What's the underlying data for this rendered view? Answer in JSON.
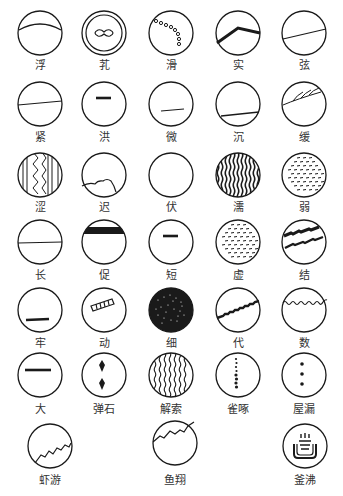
{
  "title": "",
  "pulses": [
    {
      "id": "fu",
      "label": "浮",
      "cx": 40,
      "cy": 33,
      "ly": 66,
      "shape": "arc-top"
    },
    {
      "id": "kou",
      "label": "芤",
      "cx": 104,
      "cy": 33,
      "ly": 66,
      "shape": "double-ring"
    },
    {
      "id": "hua",
      "label": "滑",
      "cx": 171,
      "cy": 33,
      "ly": 66,
      "shape": "beads"
    },
    {
      "id": "shi",
      "label": "实",
      "cx": 238,
      "cy": 33,
      "ly": 66,
      "shape": "bent-thick"
    },
    {
      "id": "xian",
      "label": "弦",
      "cx": 304,
      "cy": 33,
      "ly": 66,
      "shape": "diagonal-line"
    },
    {
      "id": "jin",
      "label": "紧",
      "cx": 40,
      "cy": 104,
      "ly": 138,
      "shape": "upper-line"
    },
    {
      "id": "hong",
      "label": "洪",
      "cx": 104,
      "cy": 104,
      "ly": 138,
      "shape": "short-top-thick"
    },
    {
      "id": "wei",
      "label": "微",
      "cx": 171,
      "cy": 104,
      "ly": 138,
      "shape": "low-thin-line"
    },
    {
      "id": "chen",
      "label": "沉",
      "cx": 238,
      "cy": 104,
      "ly": 138,
      "shape": "low-line"
    },
    {
      "id": "huan",
      "label": "缓",
      "cx": 304,
      "cy": 104,
      "ly": 138,
      "shape": "feather"
    },
    {
      "id": "se",
      "label": "涩",
      "cx": 40,
      "cy": 175,
      "ly": 208,
      "shape": "zigzag-stripes"
    },
    {
      "id": "chi",
      "label": "迟",
      "cx": 104,
      "cy": 175,
      "ly": 208,
      "shape": "low-waves"
    },
    {
      "id": "fu2",
      "label": "伏",
      "cx": 171,
      "cy": 175,
      "ly": 208,
      "shape": "empty"
    },
    {
      "id": "ru",
      "label": "濡",
      "cx": 238,
      "cy": 175,
      "ly": 208,
      "shape": "dense-stripes"
    },
    {
      "id": "ruo",
      "label": "弱",
      "cx": 304,
      "cy": 175,
      "ly": 208,
      "shape": "dashes"
    },
    {
      "id": "chang",
      "label": "长",
      "cx": 40,
      "cy": 242,
      "ly": 276,
      "shape": "mid-line"
    },
    {
      "id": "cu",
      "label": "促",
      "cx": 104,
      "cy": 242,
      "ly": 276,
      "shape": "top-band"
    },
    {
      "id": "duan",
      "label": "短",
      "cx": 171,
      "cy": 242,
      "ly": 276,
      "shape": "short-top-thick"
    },
    {
      "id": "xu",
      "label": "虚",
      "cx": 238,
      "cy": 242,
      "ly": 276,
      "shape": "dashes"
    },
    {
      "id": "jie",
      "label": "结",
      "cx": 304,
      "cy": 242,
      "ly": 276,
      "shape": "double-rough"
    },
    {
      "id": "lao",
      "label": "牢",
      "cx": 40,
      "cy": 310,
      "ly": 344,
      "shape": "low-short-thick"
    },
    {
      "id": "dong",
      "label": "动",
      "cx": 104,
      "cy": 310,
      "ly": 344,
      "shape": "ladder"
    },
    {
      "id": "xi",
      "label": "细",
      "cx": 171,
      "cy": 310,
      "ly": 344,
      "shape": "filled"
    },
    {
      "id": "dai",
      "label": "代",
      "cx": 238,
      "cy": 310,
      "ly": 344,
      "shape": "rough-diagonal"
    },
    {
      "id": "shu",
      "label": "数",
      "cx": 304,
      "cy": 310,
      "ly": 344,
      "shape": "wavy-top"
    },
    {
      "id": "da",
      "label": "大",
      "cx": 40,
      "cy": 375,
      "ly": 410,
      "shape": "upper-short-thick"
    },
    {
      "id": "tanshi",
      "label": "弹石",
      "cx": 104,
      "cy": 375,
      "ly": 410,
      "shape": "two-diamonds"
    },
    {
      "id": "jiesuo",
      "label": "解索",
      "cx": 171,
      "cy": 375,
      "ly": 410,
      "shape": "wavy-stripes"
    },
    {
      "id": "quezhuo",
      "label": "雀啄",
      "cx": 238,
      "cy": 375,
      "ly": 410,
      "shape": "dot-column"
    },
    {
      "id": "wulou",
      "label": "屋漏",
      "cx": 304,
      "cy": 375,
      "ly": 410,
      "shape": "three-dots"
    },
    {
      "id": "xiayou",
      "label": "虾游",
      "cx": 50,
      "cy": 446,
      "ly": 481,
      "shape": "low-jagged"
    },
    {
      "id": "yuxiang",
      "label": "鱼翔",
      "cx": 175,
      "cy": 443,
      "ly": 481,
      "shape": "high-jagged"
    },
    {
      "id": "fufei",
      "label": "釜沸",
      "cx": 305,
      "cy": 446,
      "ly": 481,
      "shape": "cauldron"
    }
  ],
  "colors": {
    "stroke": "#1a1a1a",
    "label": "#333333",
    "background": "#ffffff"
  }
}
